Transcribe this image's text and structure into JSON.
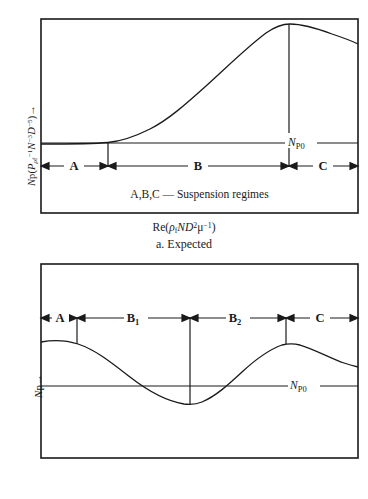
{
  "figure_a": {
    "name": "a. Expected",
    "subcaption": "a. Expected",
    "x_axis_label_html": "Re(<i>ρ</i><sub>f</sub><i>ND</i><sup>2</sup>μ<sup>−1</sup>)",
    "y_axis_label_html": "<i>N</i>p(<i>P</i><sub><i>ρ</i>f</sub><sup>−1</sup><i>N</i><sup>−3</sup><i>D</i><sup>−5</sup>)→",
    "baseline_label_html": "<i>N</i><sub>P0</sub>",
    "regimes_note": "A,B,C — Suspension regimes",
    "regions": [
      "A",
      "B",
      "C"
    ]
  },
  "figure_b": {
    "name": "b. Observed",
    "subcaption": "b. Observed",
    "x_axis_label_html": "Re →",
    "y_axis_label_html": "<i>N</i>p→",
    "baseline_label_html": "<i>N</i><sub>P0</sub>",
    "regions": [
      "A",
      "B<sub>1</sub>",
      "B<sub>2</sub>",
      "C"
    ]
  },
  "style": {
    "line_color": "#1a1a1a",
    "background": "#ffffff"
  },
  "chart_data": [
    {
      "id": "a",
      "type": "line",
      "title": "a. Expected",
      "xlabel": "Re(rho_f N D^2 mu^-1)",
      "ylabel": "Np(P rho_f^-1 N^-3 D^-5)",
      "grid": false,
      "legend": null,
      "frame": {
        "x0": 41,
        "y0": 19,
        "x1": 358,
        "y1": 213
      },
      "baseline": {
        "y": 143,
        "label": "N_P0"
      },
      "annotations": [
        {
          "type": "vertical-tick",
          "x": 108,
          "y_from": 143,
          "y_to": 166
        },
        {
          "type": "vertical-tick",
          "x": 289,
          "y_from": 24,
          "y_to": 166
        }
      ],
      "region_axis": {
        "y": 166,
        "boundaries": [
          41,
          108,
          289,
          358
        ],
        "labels": [
          "A",
          "B",
          "C"
        ]
      },
      "series": [
        {
          "name": "power number curve",
          "x": [
            41,
            70,
            90,
            105,
            118,
            132,
            148,
            165,
            182,
            200,
            218,
            236,
            252,
            268,
            282,
            289,
            300,
            320,
            340,
            358
          ],
          "y": [
            144,
            144,
            143.5,
            143,
            141,
            137,
            131,
            122,
            110,
            96,
            81,
            66,
            54,
            42,
            31,
            25,
            24,
            26,
            32,
            42
          ]
        }
      ]
    },
    {
      "id": "b",
      "type": "line",
      "title": "b. Observed",
      "xlabel": "Re",
      "ylabel": "Np",
      "grid": false,
      "legend": null,
      "frame": {
        "x0": 41,
        "y0": 264,
        "x1": 358,
        "y1": 458
      },
      "baseline": {
        "y": 386,
        "label": "N_P0"
      },
      "annotations": [
        {
          "type": "vertical-tick",
          "x": 77,
          "y_from": 318,
          "y_to": 341
        },
        {
          "type": "vertical-tick",
          "x": 190,
          "y_from": 318,
          "y_to": 404
        },
        {
          "type": "vertical-tick",
          "x": 286,
          "y_from": 318,
          "y_to": 344
        }
      ],
      "region_axis": {
        "y": 318,
        "boundaries": [
          41,
          77,
          190,
          286,
          358
        ],
        "labels": [
          "A",
          "B1",
          "B2",
          "C"
        ]
      },
      "series": [
        {
          "name": "power number curve",
          "x": [
            41,
            55,
            68,
            78,
            90,
            104,
            118,
            132,
            146,
            160,
            172,
            182,
            190,
            198,
            208,
            218,
            230,
            242,
            254,
            266,
            278,
            286,
            296,
            310,
            324,
            340,
            358
          ],
          "y": [
            342,
            340,
            341,
            344,
            350,
            358,
            368,
            378,
            388,
            396,
            402,
            404,
            404,
            403,
            399,
            392,
            383,
            372,
            360,
            350,
            344,
            344,
            346,
            352,
            358,
            363,
            366
          ]
        }
      ]
    }
  ]
}
